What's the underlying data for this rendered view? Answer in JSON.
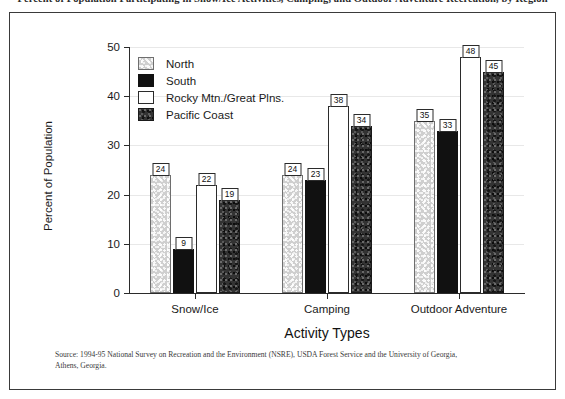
{
  "figure": {
    "clipped_title": "Percent of Population Participating in Snow/Ice Activities, Camping, and Outdoor Adventure Recreation, by Region",
    "source_note": "Source: 1994-95 National Survey on Recreation and the Environment (NSRE), USDA Forest Service and the University of Georgia, Athens, Georgia."
  },
  "chart_data": {
    "type": "bar",
    "title": "",
    "xlabel": "Activity Types",
    "ylabel": "Percent of Population",
    "ylim": [
      0,
      50
    ],
    "yticks": [
      0,
      10,
      20,
      30,
      40,
      50
    ],
    "grid": true,
    "legend_position": "upper-left-inside",
    "categories": [
      "Snow/Ice",
      "Camping",
      "Outdoor Adventure"
    ],
    "series": [
      {
        "name": "North",
        "fill": "light-speckle",
        "color": "#cfcfcf",
        "values": [
          24,
          24,
          35
        ]
      },
      {
        "name": "South",
        "fill": "solid-black",
        "color": "#111111",
        "values": [
          9,
          23,
          33
        ]
      },
      {
        "name": "Rocky Mtn./Great Plns.",
        "fill": "white-outline",
        "color": "#ffffff",
        "values": [
          22,
          38,
          48
        ]
      },
      {
        "name": "Pacific Coast",
        "fill": "dark-speckle",
        "color": "#333333",
        "values": [
          19,
          34,
          45
        ]
      }
    ]
  }
}
